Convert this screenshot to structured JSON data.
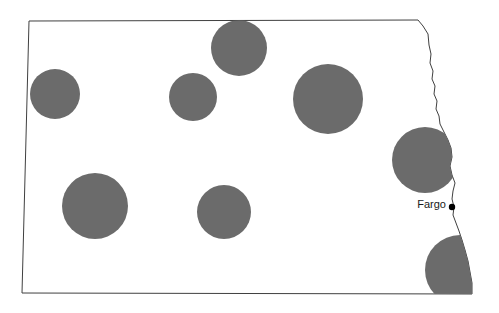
{
  "map": {
    "title": "North Dakota proportional symbol map",
    "region_name": "North Dakota",
    "background_color": "#ffffff",
    "outline_color": "#404040",
    "symbol_color": "#6b6b6b",
    "symbol_shape": "circle",
    "city_marker_color": "#000000",
    "cities": [
      {
        "name": "Fargo",
        "label": "Fargo",
        "dot_x": 452,
        "dot_y": 207,
        "label_x": 446,
        "label_y": 205
      }
    ],
    "symbols": [
      {
        "id": "symbol-northwest",
        "cx": 55,
        "cy": 94,
        "r": 25
      },
      {
        "id": "symbol-north-central",
        "cx": 193,
        "cy": 97,
        "r": 24
      },
      {
        "id": "symbol-north-top",
        "cx": 239,
        "cy": 48,
        "r": 28
      },
      {
        "id": "symbol-northeast",
        "cx": 328,
        "cy": 99,
        "r": 35
      },
      {
        "id": "symbol-east-central",
        "cx": 425,
        "cy": 160,
        "r": 33
      },
      {
        "id": "symbol-southwest",
        "cx": 95,
        "cy": 206,
        "r": 33
      },
      {
        "id": "symbol-south-central",
        "cx": 224,
        "cy": 212,
        "r": 27
      },
      {
        "id": "symbol-southeast",
        "cx": 460,
        "cy": 270,
        "r": 35
      }
    ],
    "boundary_path": "M 29,21 L 418,20 L 423,26 L 428,34 L 429,45 L 431,54 L 430,63 L 433,71 L 432,79 L 435,86 L 434,94 L 437,101 L 436,109 L 439,116 L 440,124 L 444,132 L 448,140 L 451,148 L 452,157 L 450,166 L 452,175 L 455,183 L 453,191 L 452,199 L 454,207 L 453,215 L 456,223 L 459,231 L 462,240 L 465,250 L 468,261 L 470,272 L 472,283 L 472,294 L 22,293 Z"
  }
}
